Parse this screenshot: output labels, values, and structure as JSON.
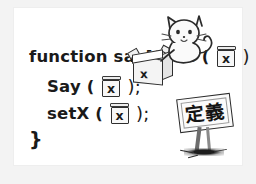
{
  "illustration": {
    "description_kind": "hand-drawn-code-diagram",
    "background_color": "#f3f3f3",
    "card_color": "#ffffff",
    "ink_color": "#1a1a1a"
  },
  "code": {
    "lines": [
      {
        "id": "line-1",
        "before_box": "function sayMove (",
        "box_glyph": "x",
        "after_box": ") {"
      },
      {
        "id": "line-2",
        "before_box": "Say (",
        "box_glyph": "x",
        "after_box": ");"
      },
      {
        "id": "line-3",
        "before_box": "setX (",
        "box_glyph": "x",
        "after_box": ");"
      },
      {
        "id": "line-4",
        "text": "}"
      }
    ]
  },
  "crate": {
    "glyph": "x",
    "label": "open-parameter-box"
  },
  "cat": {
    "label": "cat-character"
  },
  "sign": {
    "kanji": "定義",
    "meaning_label": "definition-signboard"
  }
}
